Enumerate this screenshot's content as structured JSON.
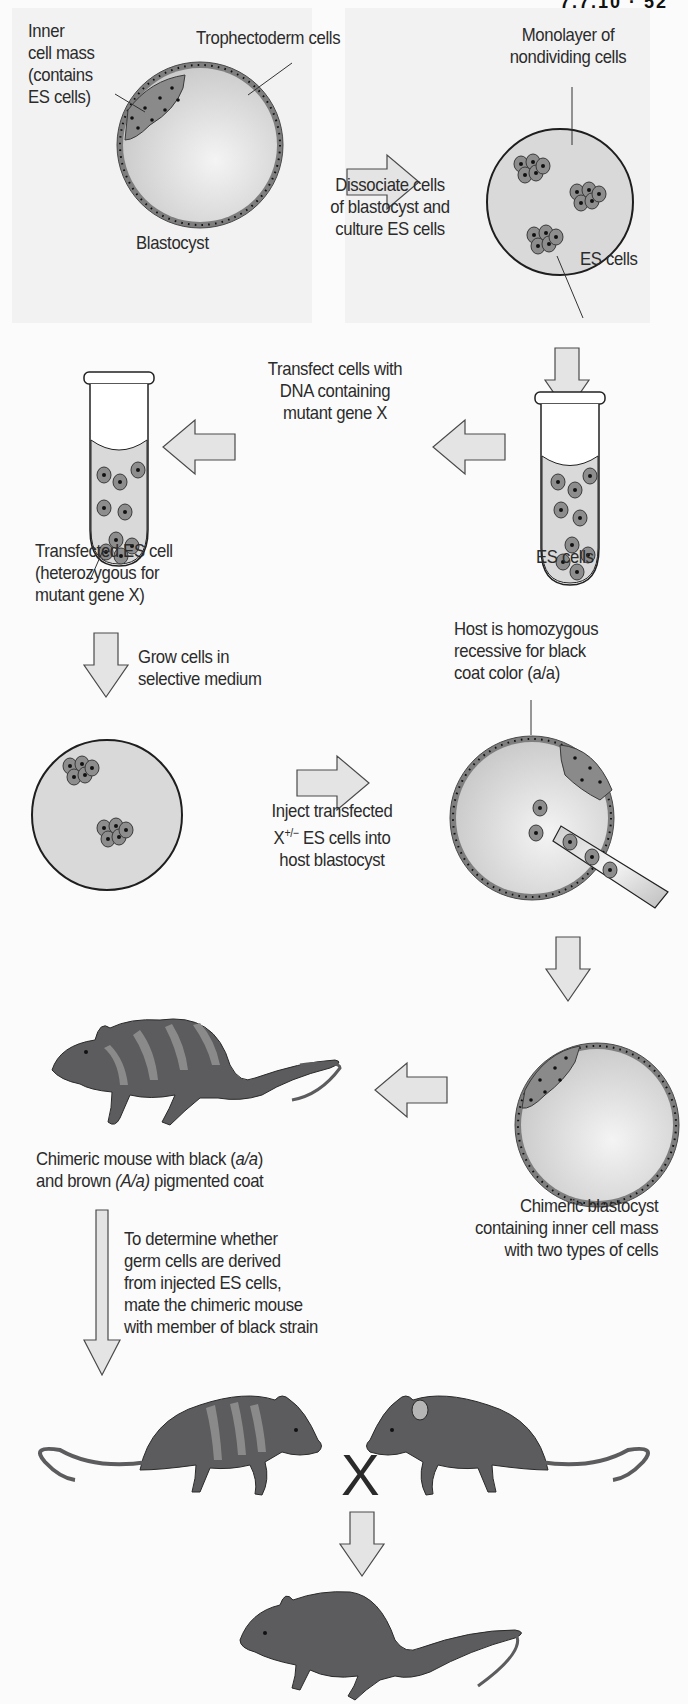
{
  "page_header": "7.7.10 · 52",
  "colors": {
    "background": "#fbfbfb",
    "panel": "#f2f2f2",
    "medium_fill": "#d7d7d7",
    "cell_fill": "#8c8c8c",
    "cell_outline": "#3a3a3a",
    "arrow_fill": "#e4e4e4",
    "mouse_dark": "#5c5c5e",
    "mouse_stripe": "#8a8a8a",
    "text": "#2b2b2b"
  },
  "steps": {
    "blastocyst": {
      "label": "Blastocyst",
      "inner_cell_mass_label": [
        "Inner",
        "cell mass",
        "(contains",
        "ES cells)"
      ],
      "trophectoderm_label": "Trophectoderm cells"
    },
    "dissociate": {
      "label": [
        "Dissociate cells",
        "of blastocyst and",
        "culture ES cells"
      ]
    },
    "monolayer": {
      "label": [
        "Monolayer of",
        "nondividing cells"
      ],
      "es_cells_label": "ES cells"
    },
    "transfect": {
      "label": [
        "Transfect cells with",
        "DNA containing",
        "mutant gene X"
      ]
    },
    "tube_right": {
      "label": "ES cells"
    },
    "tube_left": {
      "label": [
        "Transfected ES cell",
        "(heterozygous for",
        "mutant gene X)"
      ]
    },
    "grow": {
      "label": [
        "Grow cells in",
        "selective medium"
      ]
    },
    "host": {
      "label": [
        "Host is homozygous",
        "recessive for black",
        "coat color (a/a)"
      ]
    },
    "inject": {
      "label_line1": "Inject transfected",
      "label_line2_prefix": "X",
      "label_line2_sup": "+/−",
      "label_line2_suffix": " ES cells into",
      "label_line3": "host blastocyst"
    },
    "chimeric_blastocyst": {
      "label": [
        "Chimeric blastocyst",
        "containing inner cell mass",
        "with two types of cells"
      ]
    },
    "chimeric_mouse": {
      "label_line1_prefix": "Chimeric mouse with black (",
      "label_line1_italic": "a/a",
      "label_line1_suffix": ")",
      "label_line2_prefix": "and brown ",
      "label_line2_italic": "(A/a)",
      "label_line2_suffix": " pigmented coat"
    },
    "mate": {
      "label": [
        "To determine whether",
        "germ cells are derived",
        "from injected ES cells,",
        "mate the chimeric mouse",
        "with member of black strain"
      ]
    },
    "cross_symbol": "X"
  }
}
